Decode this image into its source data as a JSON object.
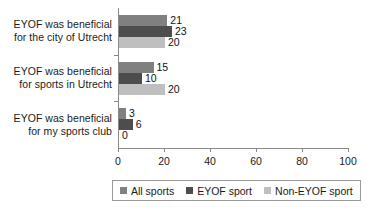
{
  "chart_data": {
    "type": "bar",
    "orientation": "horizontal",
    "title": "",
    "xlabel": "",
    "ylabel": "",
    "categories": [
      "EYOF was beneficial for the city of Utrecht",
      "EYOF was beneficial for sports in Utrecht",
      "EYOF was beneficial for my sports club"
    ],
    "category_lines": [
      [
        "EYOF was beneficial",
        "for the city of Utrecht"
      ],
      [
        "EYOF was beneficial",
        "for sports in Utrecht"
      ],
      [
        "EYOF was beneficial",
        "for my sports club"
      ]
    ],
    "series": [
      {
        "name": "All sports",
        "color": "#808080",
        "values": [
          21,
          15,
          3
        ]
      },
      {
        "name": "EYOF sport",
        "color": "#4d4d4d",
        "values": [
          23,
          10,
          6
        ]
      },
      {
        "name": "Non-EYOF sport",
        "color": "#bfbfbf",
        "values": [
          20,
          20,
          0
        ]
      }
    ],
    "xlim": [
      0,
      100
    ],
    "xticks": [
      0,
      20,
      40,
      60,
      80,
      100
    ],
    "xtick_labels": [
      "0",
      "20",
      "40",
      "60",
      "80",
      "100"
    ],
    "grid": false,
    "legend_position": "bottom",
    "data_labels": [
      [
        "21",
        "23",
        "20"
      ],
      [
        "15",
        "10",
        "20"
      ],
      [
        "3",
        "6",
        "0"
      ]
    ]
  },
  "legend": {
    "items": [
      {
        "label": "All sports",
        "color": "#808080"
      },
      {
        "label": "EYOF sport",
        "color": "#4d4d4d"
      },
      {
        "label": "Non-EYOF sport",
        "color": "#bfbfbf"
      }
    ]
  },
  "axis": {
    "tick_labels": [
      "0",
      "20",
      "40",
      "60",
      "80",
      "100"
    ]
  }
}
